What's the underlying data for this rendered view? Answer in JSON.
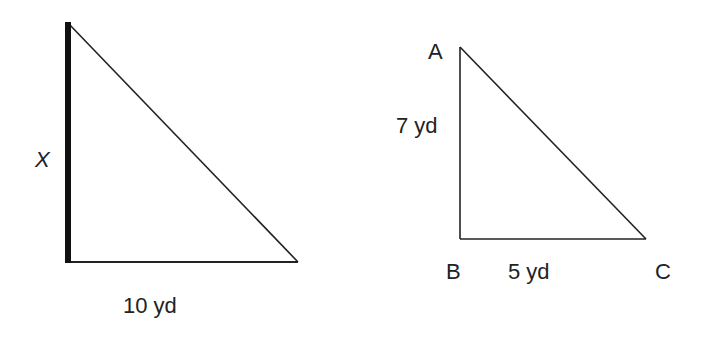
{
  "diagram": {
    "type": "similar-right-triangles",
    "colors": {
      "stroke": "#222222",
      "highlight_side": "#111111",
      "background": "#ffffff"
    },
    "left_triangle": {
      "vertical_side_label": "X",
      "horizontal_side_label": "10 yd",
      "highlighted_side": "vertical"
    },
    "right_triangle": {
      "vertices": {
        "top": "A",
        "right_angle": "B",
        "right": "C"
      },
      "side_AB_label": "7 yd",
      "side_BC_label": "5 yd"
    }
  }
}
